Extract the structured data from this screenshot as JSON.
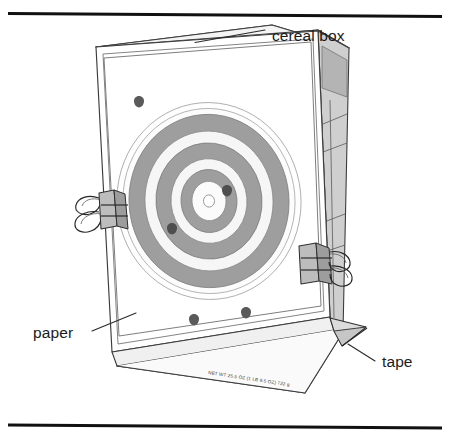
{
  "figure": {
    "background_color": "#ffffff"
  },
  "rules": {
    "top": {
      "name": "top-rule",
      "color": "#111111"
    },
    "bottom": {
      "name": "bottom-rule",
      "color": "#111111"
    }
  },
  "labels": [
    {
      "id": "cereal-box",
      "text": "cereal box"
    },
    {
      "id": "paper",
      "text": "paper"
    },
    {
      "id": "tape",
      "text": "tape"
    }
  ],
  "box": {
    "front_face_color": "#ffffff",
    "side_face_color": "#c9c9c9",
    "top_face_color": "#f2f2f2",
    "edge_color": "#3c3c3c",
    "net_weight_text": "NET WT 25.5 OZ (1 LB 9.5 OZ) 722 g"
  },
  "target": {
    "name": "paper-target",
    "ring_light_color": "#f7f7f7",
    "ring_dark_color": "#9a9a9a",
    "ring_mid_color": "#b8b8b8",
    "outline_color": "#7a7a7a",
    "ring_count": 6,
    "rings": [
      {
        "index": 0,
        "fill": "#fdfdfd",
        "label": "outer-halo"
      },
      {
        "index": 1,
        "fill": "#9a9a9a",
        "label": "ring-dark-1"
      },
      {
        "index": 2,
        "fill": "#f5f5f5",
        "label": "ring-light-1"
      },
      {
        "index": 3,
        "fill": "#9a9a9a",
        "label": "ring-dark-2"
      },
      {
        "index": 4,
        "fill": "#f5f5f5",
        "label": "ring-light-2"
      },
      {
        "index": 5,
        "fill": "#9a9a9a",
        "label": "ring-dark-3"
      },
      {
        "index": 6,
        "fill": "#fbfbfb",
        "label": "bullseye"
      }
    ]
  },
  "bullet_holes": {
    "name": "bullet-holes",
    "color": "#555555",
    "count": 5,
    "positions": [
      {
        "x": 139,
        "y": 100
      },
      {
        "x": 227,
        "y": 190
      },
      {
        "x": 172,
        "y": 228
      },
      {
        "x": 194,
        "y": 319
      },
      {
        "x": 246,
        "y": 312
      }
    ]
  },
  "clips": {
    "name": "binder-clips",
    "body_color": "#b5b5b5",
    "handle_color": "#dcdcdc",
    "count": 2,
    "items": [
      {
        "id": "left-clip",
        "side": "left"
      },
      {
        "id": "right-clip",
        "side": "right"
      }
    ]
  },
  "tape": {
    "name": "tape-flap",
    "color": "#d8d8d8"
  },
  "side_panel": {
    "name": "side-panel-lines",
    "line_count": 3,
    "header_color": "#b0b0b0"
  }
}
